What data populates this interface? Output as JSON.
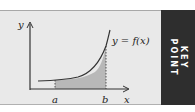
{
  "diagram": {
    "type": "area-under-curve",
    "labels": {
      "y_axis": "y",
      "x_axis": "x",
      "lower_bound": "a",
      "upper_bound": "b",
      "curve": "y = f(x)"
    },
    "colors": {
      "background": "#e9e9e9",
      "shaded_area": "#b8b8b8",
      "curve": "#333333",
      "panel": "#2e2e2e"
    }
  },
  "side_panel": {
    "line1": "KEY",
    "line2": "POINT"
  }
}
